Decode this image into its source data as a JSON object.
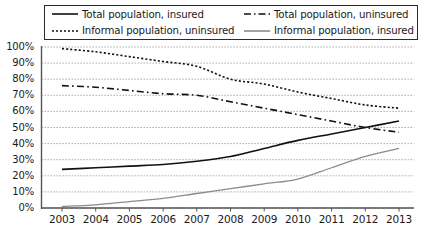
{
  "chart_data": {
    "type": "line",
    "title": "",
    "xlabel": "",
    "ylabel": "",
    "x": [
      2003,
      2004,
      2005,
      2006,
      2007,
      2008,
      2009,
      2010,
      2011,
      2012,
      2013
    ],
    "categories": [
      "2003",
      "2004",
      "2005",
      "2006",
      "2007",
      "2008",
      "2009",
      "2010",
      "2011",
      "2012",
      "2013"
    ],
    "ylim": [
      0,
      100
    ],
    "xlim": [
      2003,
      2013
    ],
    "yticks": [
      0,
      10,
      20,
      30,
      40,
      50,
      60,
      70,
      80,
      90,
      100
    ],
    "ytick_labels": [
      "0%",
      "10%",
      "20%",
      "30%",
      "40%",
      "50%",
      "60%",
      "70%",
      "80%",
      "90%",
      "100%"
    ],
    "grid": true,
    "grid_style": "dotted-horizontal",
    "legend_position": "top",
    "series": [
      {
        "name": "Total population, insured",
        "style": "solid",
        "color": "#111111",
        "values": [
          24,
          25,
          26,
          27,
          29,
          32,
          37,
          42,
          46,
          50,
          54
        ]
      },
      {
        "name": "Total population, uninsured",
        "style": "dashed",
        "color": "#111111",
        "values": [
          76,
          75,
          73,
          71,
          70,
          66,
          62,
          58,
          54,
          50,
          47
        ]
      },
      {
        "name": "Informal population, uninsured",
        "style": "dotted",
        "color": "#111111",
        "values": [
          99,
          97,
          94,
          91,
          88,
          80,
          77,
          72,
          68,
          64,
          62
        ]
      },
      {
        "name": "Informal population, insured",
        "style": "solid-gray",
        "color": "#8c8c8c",
        "values": [
          1,
          2,
          4,
          6,
          9,
          12,
          15,
          18,
          25,
          32,
          37
        ]
      }
    ]
  },
  "legend": {
    "items": [
      {
        "label": "Total population, insured",
        "swatch": "solid-line-swatch"
      },
      {
        "label": "Total population, uninsured",
        "swatch": "dash-dot-line-swatch"
      },
      {
        "label": "Informal population, uninsured",
        "swatch": "dotted-line-swatch"
      },
      {
        "label": "Informal population, insured",
        "swatch": "gray-solid-line-swatch"
      }
    ]
  },
  "colors": {
    "axis": "#555555",
    "grid": "#9a9a9a",
    "series_dark": "#111111",
    "series_gray": "#8c8c8c",
    "background": "#ffffff"
  }
}
